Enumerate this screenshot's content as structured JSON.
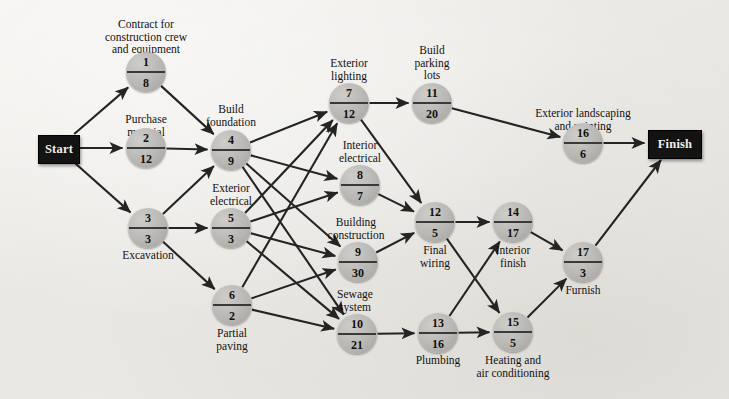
{
  "diagram": {
    "start_label": "Start",
    "finish_label": "Finish",
    "node_shape": "circle-split",
    "colors": {
      "background": "#eeece8",
      "node_fill": "#b9b7b3",
      "terminal_fill": "#131313",
      "edge": "#242424",
      "text": "#121212"
    },
    "legend_note": "Top number = activity number, bottom number = duration"
  },
  "terminals": [
    {
      "id": "start",
      "label": "Start",
      "x": 58,
      "y": 148,
      "w": 40,
      "h": 27
    },
    {
      "id": "finish",
      "label": "Finish",
      "x": 674,
      "y": 143,
      "w": 52,
      "h": 27
    }
  ],
  "nodes": [
    {
      "id": 1,
      "number": "1",
      "duration": "8",
      "name": "Contract for\nconstruction crew\nand equipment",
      "x": 146,
      "y": 72,
      "label_x": 146,
      "label_y": 18,
      "label_pos": "above"
    },
    {
      "id": 2,
      "number": "2",
      "duration": "12",
      "name": "Purchase\nmaterial",
      "x": 146,
      "y": 148,
      "label_x": 146,
      "label_y": 113,
      "label_pos": "above"
    },
    {
      "id": 3,
      "number": "3",
      "duration": "3",
      "name": "Excavation",
      "x": 148,
      "y": 228,
      "label_x": 148,
      "label_y": 249,
      "label_pos": "below"
    },
    {
      "id": 4,
      "number": "4",
      "duration": "9",
      "name": "Build\nfoundation",
      "x": 231,
      "y": 150,
      "label_x": 231,
      "label_y": 103,
      "label_pos": "above"
    },
    {
      "id": 5,
      "number": "5",
      "duration": "3",
      "name": "Exterior\nelectrical",
      "x": 231,
      "y": 228,
      "label_x": 231,
      "label_y": 182,
      "label_pos": "above"
    },
    {
      "id": 6,
      "number": "6",
      "duration": "2",
      "name": "Partial\npaving",
      "x": 232,
      "y": 305,
      "label_x": 232,
      "label_y": 327,
      "label_pos": "below"
    },
    {
      "id": 7,
      "number": "7",
      "duration": "12",
      "name": "Exterior\nlighting",
      "x": 349,
      "y": 103,
      "label_x": 349,
      "label_y": 57,
      "label_pos": "above"
    },
    {
      "id": 8,
      "number": "8",
      "duration": "7",
      "name": "Interior\nelectrical",
      "x": 360,
      "y": 185,
      "label_x": 360,
      "label_y": 139,
      "label_pos": "above"
    },
    {
      "id": 9,
      "number": "9",
      "duration": "30",
      "name": "Building\nconstruction",
      "x": 358,
      "y": 262,
      "label_x": 356,
      "label_y": 216,
      "label_pos": "above"
    },
    {
      "id": 10,
      "number": "10",
      "duration": "21",
      "name": "Sewage\nsystem",
      "x": 357,
      "y": 334,
      "label_x": 355,
      "label_y": 288,
      "label_pos": "above"
    },
    {
      "id": 11,
      "number": "11",
      "duration": "20",
      "name": "Build\nparking\nlots",
      "x": 432,
      "y": 103,
      "label_x": 432,
      "label_y": 44,
      "label_pos": "above"
    },
    {
      "id": 12,
      "number": "12",
      "duration": "5",
      "name": "Final\nwiring",
      "x": 435,
      "y": 222,
      "label_x": 435,
      "label_y": 244,
      "label_pos": "below"
    },
    {
      "id": 13,
      "number": "13",
      "duration": "16",
      "name": "Plumbing",
      "x": 438,
      "y": 333,
      "label_x": 438,
      "label_y": 354,
      "label_pos": "below"
    },
    {
      "id": 14,
      "number": "14",
      "duration": "17",
      "name": "Interior\nfinish",
      "x": 513,
      "y": 222,
      "label_x": 513,
      "label_y": 244,
      "label_pos": "below"
    },
    {
      "id": 15,
      "number": "15",
      "duration": "5",
      "name": "Heating and\nair conditioning",
      "x": 513,
      "y": 332,
      "label_x": 513,
      "label_y": 354,
      "label_pos": "below"
    },
    {
      "id": 16,
      "number": "16",
      "duration": "6",
      "name": "Exterior landscaping\nand painting",
      "x": 583,
      "y": 143,
      "label_x": 583,
      "label_y": 107,
      "label_pos": "above"
    },
    {
      "id": 17,
      "number": "17",
      "duration": "3",
      "name": "Furnish",
      "x": 583,
      "y": 262,
      "label_x": 583,
      "label_y": 284,
      "label_pos": "below"
    }
  ],
  "edges": [
    {
      "from": "start",
      "to": 1
    },
    {
      "from": "start",
      "to": 2
    },
    {
      "from": "start",
      "to": 3
    },
    {
      "from": 1,
      "to": 4
    },
    {
      "from": 2,
      "to": 4
    },
    {
      "from": 3,
      "to": 4
    },
    {
      "from": 3,
      "to": 5
    },
    {
      "from": 3,
      "to": 6
    },
    {
      "from": 4,
      "to": 7
    },
    {
      "from": 4,
      "to": 8
    },
    {
      "from": 4,
      "to": 9
    },
    {
      "from": 4,
      "to": 10
    },
    {
      "from": 5,
      "to": 7
    },
    {
      "from": 5,
      "to": 8
    },
    {
      "from": 5,
      "to": 9
    },
    {
      "from": 5,
      "to": 10
    },
    {
      "from": 6,
      "to": 7
    },
    {
      "from": 6,
      "to": 9
    },
    {
      "from": 6,
      "to": 10
    },
    {
      "from": 7,
      "to": 11
    },
    {
      "from": 7,
      "to": 12
    },
    {
      "from": 8,
      "to": 12
    },
    {
      "from": 9,
      "to": 12
    },
    {
      "from": 10,
      "to": 13
    },
    {
      "from": 11,
      "to": 16
    },
    {
      "from": 12,
      "to": 14
    },
    {
      "from": 12,
      "to": 15
    },
    {
      "from": 13,
      "to": 15
    },
    {
      "from": 13,
      "to": 14
    },
    {
      "from": 14,
      "to": 17
    },
    {
      "from": 15,
      "to": 17
    },
    {
      "from": 16,
      "to": "finish"
    },
    {
      "from": 17,
      "to": "finish"
    }
  ],
  "chart_data": {
    "type": "diagram",
    "node_count": 17,
    "activities": [
      {
        "number": 1,
        "name": "Contract for construction crew and equipment",
        "duration": 8
      },
      {
        "number": 2,
        "name": "Purchase material",
        "duration": 12
      },
      {
        "number": 3,
        "name": "Excavation",
        "duration": 3
      },
      {
        "number": 4,
        "name": "Build foundation",
        "duration": 9
      },
      {
        "number": 5,
        "name": "Exterior electrical",
        "duration": 3
      },
      {
        "number": 6,
        "name": "Partial paving",
        "duration": 2
      },
      {
        "number": 7,
        "name": "Exterior lighting",
        "duration": 12
      },
      {
        "number": 8,
        "name": "Interior electrical",
        "duration": 7
      },
      {
        "number": 9,
        "name": "Building construction",
        "duration": 30
      },
      {
        "number": 10,
        "name": "Sewage system",
        "duration": 21
      },
      {
        "number": 11,
        "name": "Build parking lots",
        "duration": 20
      },
      {
        "number": 12,
        "name": "Final wiring",
        "duration": 5
      },
      {
        "number": 13,
        "name": "Plumbing",
        "duration": 16
      },
      {
        "number": 14,
        "name": "Interior finish",
        "duration": 17
      },
      {
        "number": 15,
        "name": "Heating and air conditioning",
        "duration": 5
      },
      {
        "number": 16,
        "name": "Exterior landscaping and painting",
        "duration": 6
      },
      {
        "number": 17,
        "name": "Furnish",
        "duration": 3
      }
    ]
  }
}
